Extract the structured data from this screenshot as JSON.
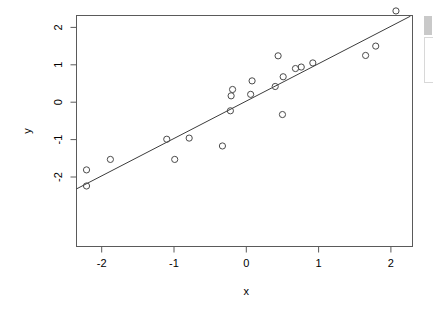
{
  "chart_data": {
    "type": "scatter",
    "title": "",
    "xlabel": "x",
    "ylabel": "y",
    "xlim": [
      -2.35,
      2.27
    ],
    "ylim": [
      -2.4,
      2.6
    ],
    "xticks": [
      -2,
      -1,
      0,
      1,
      2
    ],
    "xtick_labels": [
      "-2",
      "-1",
      "0",
      "1",
      "2"
    ],
    "yticks": [
      -2,
      -1,
      0,
      1,
      2
    ],
    "ytick_labels": [
      "-2",
      "-1",
      "0",
      "1",
      "2"
    ],
    "grid": false,
    "legend": null,
    "point_marker": "open-circle",
    "points": [
      {
        "x": -2.21,
        "y": -2.24
      },
      {
        "x": -2.21,
        "y": -1.81
      },
      {
        "x": -1.88,
        "y": -1.53
      },
      {
        "x": -1.1,
        "y": -0.99
      },
      {
        "x": -0.99,
        "y": -1.53
      },
      {
        "x": -0.79,
        "y": -0.96
      },
      {
        "x": -0.33,
        "y": -1.17
      },
      {
        "x": -0.22,
        "y": -0.23
      },
      {
        "x": -0.21,
        "y": 0.17
      },
      {
        "x": -0.19,
        "y": 0.34
      },
      {
        "x": 0.06,
        "y": 0.21
      },
      {
        "x": 0.08,
        "y": 0.57
      },
      {
        "x": 0.4,
        "y": 0.42
      },
      {
        "x": 0.44,
        "y": 1.24
      },
      {
        "x": 0.5,
        "y": -0.33
      },
      {
        "x": 0.51,
        "y": 0.68
      },
      {
        "x": 0.68,
        "y": 0.9
      },
      {
        "x": 0.76,
        "y": 0.94
      },
      {
        "x": 0.92,
        "y": 1.05
      },
      {
        "x": 1.65,
        "y": 1.25
      },
      {
        "x": 1.79,
        "y": 1.5
      },
      {
        "x": 2.07,
        "y": 2.44
      }
    ],
    "fit_line": {
      "type": "linear-regression",
      "slope": 1.0,
      "intercept": 0.03,
      "x_start": -2.35,
      "x_end": 2.27
    }
  },
  "axes": {
    "y_title": "y",
    "x_title": "x"
  },
  "scrollbar": {
    "present": true
  }
}
